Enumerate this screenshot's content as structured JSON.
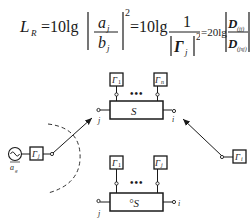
{
  "formula": {
    "lhs": "L",
    "lhs_sub": "R",
    "eq1": "=10lg",
    "frac1_num": "a",
    "frac1_num_sub": "j",
    "frac1_den": "b",
    "frac1_den_sub": "j",
    "pow": "2",
    "eq2": "=10lg",
    "frac2_num": "1",
    "frac2_den": "Γ",
    "frac2_den_sub": "j",
    "eq3": "= 20lg",
    "frac3_num": "D",
    "frac3_num_sub": "(jj)",
    "frac3_den": "D",
    "frac3_den_sub": "(jsj)"
  },
  "top_network": {
    "label": "S",
    "load_left": "Γ",
    "load_left_sub": "1",
    "load_right": "Γ",
    "load_right_sub": "n",
    "dots": "•••",
    "port_left": "j",
    "port_right": "i"
  },
  "bottom_network": {
    "label": "°S",
    "load_left": "Γ",
    "load_left_sub": "1",
    "load_right": "Γ",
    "load_right_sub": "j",
    "dots": "•••",
    "port_left": "j",
    "port_right": "i"
  },
  "source": {
    "load": "Γ",
    "load_sub": "j",
    "label": "a",
    "label_sub": "g"
  },
  "right_load": {
    "load": "Γ",
    "load_sub": "i"
  }
}
